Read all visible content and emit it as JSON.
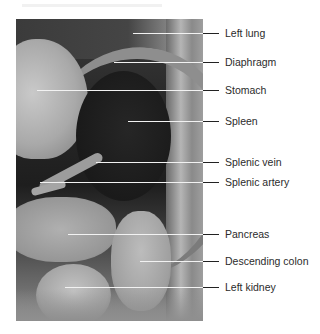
{
  "figure": {
    "photo_description": "Grayscale dissection photograph of the left upper abdominal cavity",
    "labels": [
      {
        "id": "left-lung",
        "text": "Left lung",
        "y": 33,
        "line_start_x": 133
      },
      {
        "id": "diaphragm",
        "text": "Diaphragm",
        "y": 62,
        "line_start_x": 114
      },
      {
        "id": "stomach",
        "text": "Stomach",
        "y": 90,
        "line_start_x": 37
      },
      {
        "id": "spleen",
        "text": "Spleen",
        "y": 121,
        "line_start_x": 128
      },
      {
        "id": "splenic-vein",
        "text": "Splenic vein",
        "y": 162,
        "line_start_x": 96
      },
      {
        "id": "splenic-artery",
        "text": "Splenic artery",
        "y": 182,
        "line_start_x": 40
      },
      {
        "id": "pancreas",
        "text": "Pancreas",
        "y": 234,
        "line_start_x": 68
      },
      {
        "id": "descending-colon",
        "text": "Descending colon",
        "y": 261,
        "line_start_x": 140
      },
      {
        "id": "left-kidney",
        "text": "Left kidney",
        "y": 287,
        "line_start_x": 65
      }
    ]
  },
  "colors": {
    "label_text": "#2b2b2b",
    "line_inside_photo": "#f2f2f2",
    "line_outside_photo": "#222222"
  }
}
